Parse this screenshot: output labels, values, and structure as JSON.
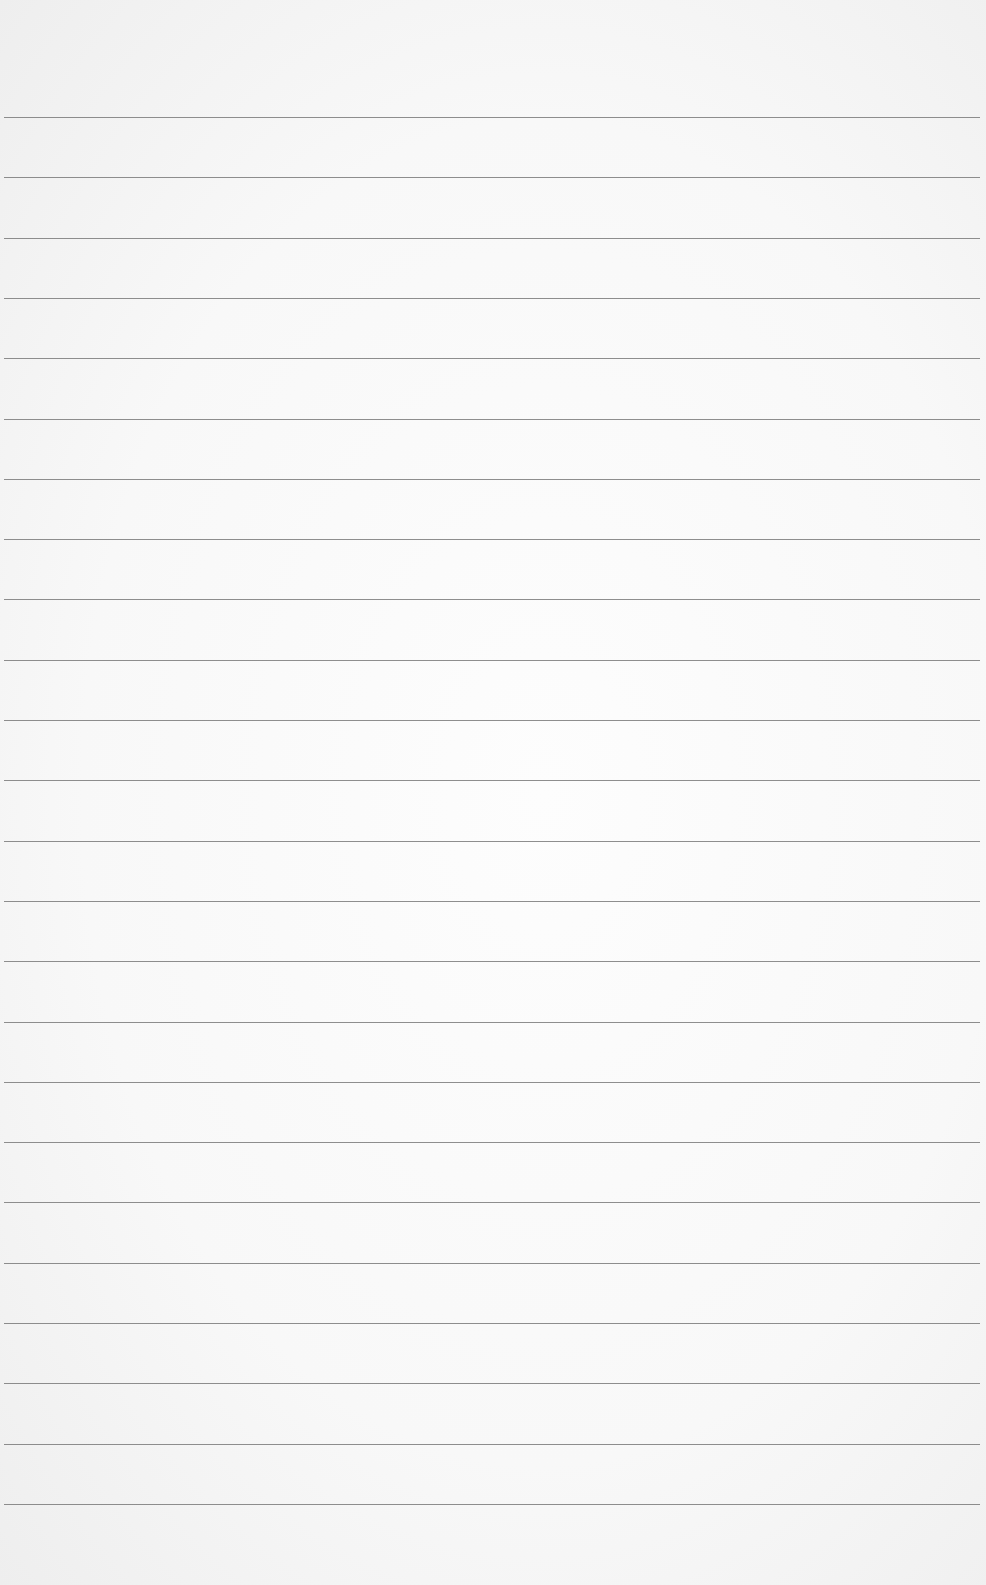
{
  "paper": {
    "type": "lined-paper",
    "background_color": "#f8f8f8",
    "line_color": "#7a7a7a",
    "line_count": 24,
    "first_line_y": 117,
    "line_spacing": 60.3
  }
}
